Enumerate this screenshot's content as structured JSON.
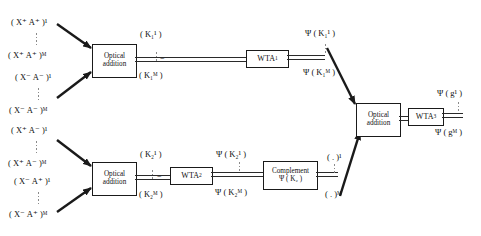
{
  "diagram": {
    "inputs_top": [
      {
        "text": "( X⁺ A⁺ )¹"
      },
      {
        "text": "( X⁺ A⁺ )ᴹ"
      },
      {
        "text": "( X⁻ A⁻ )¹"
      },
      {
        "text": "( X⁻ A⁻ )ᴹ"
      }
    ],
    "inputs_bottom": [
      {
        "text": "( X⁺ A⁻ )¹"
      },
      {
        "text": "( X⁺ A⁻ )ᴹ"
      },
      {
        "text": "( X⁻ A⁺ )¹"
      },
      {
        "text": "( X⁻ A⁺ )ᴹ"
      }
    ],
    "blocks": {
      "optical_addition_1": {
        "line1": "Optical",
        "line2": "addition"
      },
      "optical_addition_2": {
        "line1": "Optical",
        "line2": "addition"
      },
      "optical_addition_3": {
        "line1": "Optical",
        "line2": "addition"
      },
      "wta_1": {
        "label": "WTA",
        "sub": "1"
      },
      "wta_2": {
        "label": "WTA",
        "sub": "2"
      },
      "wta_3": {
        "label": "WTA",
        "sub": "3"
      },
      "complement": {
        "line1": "Complement",
        "line2": "Ψ ( K₂ )"
      }
    },
    "bus_labels": {
      "k1_top": "( K₁¹ )",
      "k1_bottom": "( K₁ᴹ )",
      "k2_top": "( K₂¹ )",
      "k2_bottom": "( K₂ᴹ )",
      "psi_k1_top": "Ψ ( K₁¹ )",
      "psi_k1_bottom": "Ψ ( K₁ᴹ )",
      "psi_k2_top": "Ψ ( K₂¹ )",
      "psi_k2_bottom": "Ψ ( K₂ᴹ )",
      "comp_top": "( . )¹",
      "comp_bottom": "( . )ᴹ",
      "psi_g_top": "Ψ ( g¹ )",
      "psi_g_bottom": "Ψ ( gᴹ )"
    },
    "colors": {
      "line": "#2a2a2a",
      "box_border": "#1a1a1a",
      "text": "#111111",
      "dots": "#8a8a8a",
      "background": "#ffffff"
    }
  }
}
